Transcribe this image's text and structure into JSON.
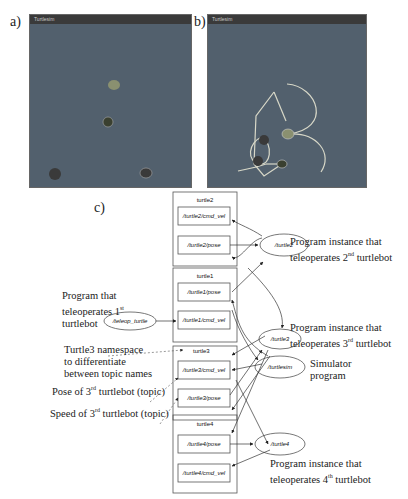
{
  "panels": {
    "a": {
      "label": "a)",
      "window_title": "Turtlesim"
    },
    "b": {
      "label": "b)",
      "window_title": "Turtlesim"
    },
    "c": {
      "label": "c)"
    }
  },
  "graph": {
    "groups": [
      {
        "name": "turtle2",
        "topics": [
          "/turtle2/cmd_vel",
          "/turtle2/pose"
        ]
      },
      {
        "name": "turtle1",
        "topics": [
          "/turtle1/pose",
          "/turtle1/cmd_vel"
        ]
      },
      {
        "name": "turtle3",
        "topics": [
          "/turtle3/cmd_vel",
          "/turtle3/pose"
        ]
      },
      {
        "name": "turtle4",
        "topics": [
          "/turtle4/pose",
          "/turtle4/cmd_vel"
        ]
      }
    ],
    "nodes": [
      "/teleop_turtle",
      "/turtle2",
      "/turtle3",
      "/turtlesim",
      "/turtle4"
    ]
  },
  "annotations": {
    "teleop1": {
      "line1": "Program that",
      "line2": "teleoperates 1",
      "sup": "st",
      "line3": "turtlebot"
    },
    "ns": {
      "line1": "Turtle3 namespace",
      "line2": "to differentiate",
      "line3": "between topic names"
    },
    "pose3": {
      "text": "Pose of 3",
      "sup": "rd",
      "rest": " turtlebot (topic)"
    },
    "speed3": {
      "text": "Speed of 3",
      "sup": "rd",
      "rest": " turtlebot (topic)"
    },
    "inst2": {
      "line1": "Program instance that",
      "line2a": "teleoperates 2",
      "sup": "nd",
      "line2b": " turtlebot"
    },
    "inst3": {
      "line1": "Program instance that",
      "line2a": "teleoperates 3",
      "sup": "rd",
      "line2b": " turtlebot"
    },
    "sim": {
      "line1": "Simulator",
      "line2": "program"
    },
    "inst4": {
      "line1": "Program instance that",
      "line2a": "teleoperates 4",
      "sup": "th",
      "line2b": " turtlebot"
    }
  }
}
